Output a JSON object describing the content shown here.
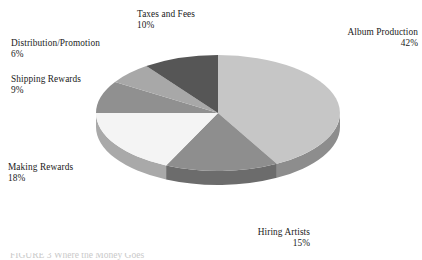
{
  "chart_data": {
    "type": "pie",
    "title": "",
    "subtitle": "",
    "xlabel": "",
    "ylabel": "",
    "three_d": true,
    "grid": false,
    "legend_position": "none",
    "labels_position": "outside-callout",
    "start_angle_deg": 0,
    "direction": "clockwise",
    "total_percent": 100,
    "categories": [
      "Album Production",
      "Hiring Artists",
      "Making Rewards",
      "Shipping Rewards",
      "Distribution/Promotion",
      "Taxes and Fees"
    ],
    "values": [
      42,
      15,
      18,
      9,
      6,
      10
    ],
    "value_unit": "%",
    "slices": [
      {
        "label": "Album Production",
        "value": 42,
        "value_text": "42%",
        "color": "#c6c6c6",
        "side_color": "#8d8d8d"
      },
      {
        "label": "Hiring Artists",
        "value": 15,
        "value_text": "15%",
        "color": "#8e8e8e",
        "side_color": "#6c6c6c"
      },
      {
        "label": "Making Rewards",
        "value": 18,
        "value_text": "18%",
        "color": "#f4f4f4",
        "side_color": "#a9a9a9"
      },
      {
        "label": "Shipping Rewards",
        "value": 9,
        "value_text": "9%",
        "color": "#909090",
        "side_color": "#6d6d6d"
      },
      {
        "label": "Distribution/Promotion",
        "value": 6,
        "value_text": "6%",
        "color": "#a8a8a8",
        "side_color": "#7d7d7d"
      },
      {
        "label": "Taxes and Fees",
        "value": 10,
        "value_text": "10%",
        "color": "#565656",
        "side_color": "#454545"
      }
    ]
  },
  "labels": {
    "album_production": {
      "name": "Album Production",
      "percent": "42%"
    },
    "hiring_artists": {
      "name": "Hiring Artists",
      "percent": "15%"
    },
    "making_rewards": {
      "name": "Making Rewards",
      "percent": "18%"
    },
    "shipping_rewards": {
      "name": "Shipping Rewards",
      "percent": "9%"
    },
    "distribution_promotion": {
      "name": "Distribution/Promotion",
      "percent": "6%"
    },
    "taxes_and_fees": {
      "name": "Taxes and Fees",
      "percent": "10%"
    }
  },
  "caption": {
    "cut_off_text": "FIGURE 3  Where the Money Goes"
  },
  "colors": {
    "background": "#ffffff",
    "text": "#1a1a1a",
    "album_production": "#c6c6c6",
    "hiring_artists": "#8e8e8e",
    "making_rewards": "#f4f4f4",
    "shipping_rewards": "#909090",
    "distribution_promotion": "#a8a8a8",
    "taxes_and_fees": "#565656"
  }
}
